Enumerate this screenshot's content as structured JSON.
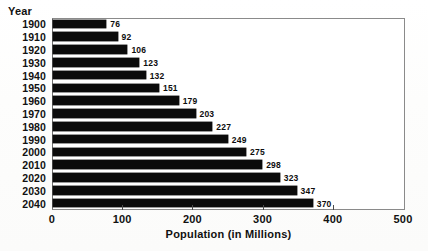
{
  "labels": {
    "year_axis_caption": "Year"
  },
  "chart_data": {
    "type": "bar",
    "orientation": "horizontal",
    "title": "",
    "xlabel": "Population (in Millions)",
    "ylabel": "Year",
    "xlim": [
      0,
      500
    ],
    "xticks": [
      "0",
      "100",
      "200",
      "300",
      "400",
      "500"
    ],
    "xtick_values": [
      0,
      100,
      200,
      300,
      400,
      500
    ],
    "grid": false,
    "legend": false,
    "bar_color": "#0b0b0b",
    "categories": [
      "1900",
      "1910",
      "1920",
      "1930",
      "1940",
      "1950",
      "1960",
      "1970",
      "1980",
      "1990",
      "2000",
      "2010",
      "2020",
      "2030",
      "2040"
    ],
    "values": [
      76,
      92,
      106,
      123,
      132,
      151,
      179,
      203,
      227,
      249,
      275,
      298,
      323,
      347,
      370
    ],
    "data_labels": [
      "76",
      "92",
      "106",
      "123",
      "132",
      "151",
      "179",
      "203",
      "227",
      "249",
      "275",
      "298",
      "323",
      "347",
      "370"
    ]
  }
}
